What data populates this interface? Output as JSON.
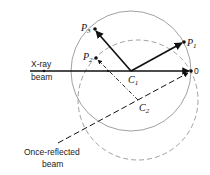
{
  "labels": {
    "xray_line1": "X-ray",
    "xray_line2": "beam",
    "reflected_line1": "Once-reflected",
    "reflected_line2": "beam",
    "origin": "0",
    "points": [
      {
        "id": "P3",
        "letter": "P",
        "sub": "3"
      },
      {
        "id": "P2",
        "letter": "P",
        "sub": "2"
      },
      {
        "id": "P1",
        "letter": "P",
        "sub": "1"
      },
      {
        "id": "C1",
        "letter": "C",
        "sub": "1"
      },
      {
        "id": "C2",
        "letter": "C",
        "sub": "2"
      }
    ]
  },
  "colors": {
    "ink": "#111111",
    "circle": "#888888"
  }
}
